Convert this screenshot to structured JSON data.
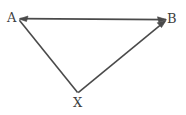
{
  "figure": {
    "type": "vector-triangle-diagram",
    "background_color": "#ffffff",
    "stroke_color": "#4a4a4a",
    "label_color": "#3f3f3f",
    "stroke_width": 1.6,
    "width": 186,
    "height": 115
  },
  "vertices": [
    {
      "id": "A",
      "label": "A",
      "x": 19,
      "y": 19,
      "label_x": 7,
      "label_y": 11
    },
    {
      "id": "B",
      "label": "B",
      "x": 166,
      "y": 20,
      "label_x": 167,
      "label_y": 12
    },
    {
      "id": "X",
      "label": "X",
      "x": 78,
      "y": 93,
      "label_x": 73,
      "label_y": 96
    }
  ],
  "edges": [
    {
      "id": "edge-b-to-a",
      "name": "arrow-B-to-A",
      "from": "B",
      "to": "A",
      "arrowhead_at": "A",
      "directed": true,
      "path": "M 166 19.6 L 20.2 18.6"
    },
    {
      "id": "edge-a-to-x",
      "name": "line-A-to-X",
      "from": "A",
      "to": "X",
      "arrowhead_at": "none",
      "directed": false,
      "path": "M 19.4 20.2 L 77.6 92.6"
    },
    {
      "id": "edge-x-to-b",
      "name": "arrow-X-to-B",
      "from": "X",
      "to": "B",
      "arrowhead_at": "B",
      "directed": true,
      "path": "M 78.2 92.6 L 164.6 21.6"
    }
  ],
  "arrowheads": [
    {
      "id": "head-at-A",
      "name": "arrowhead-at-A",
      "tip_x": 19,
      "tip_y": 19,
      "points": "19,19 28,16 26.5,21.5"
    },
    {
      "id": "head-at-B-top",
      "name": "arrowhead-at-B-from-A",
      "tip_x": 166,
      "tip_y": 19.6,
      "points": "166.5,19.6 157.5,16.8 158.8,22.3"
    },
    {
      "id": "head-at-B-diag",
      "name": "arrowhead-at-B-from-X",
      "tip_x": 166,
      "tip_y": 20.5,
      "points": "166,20.5 157.2,22.8 161.5,27.6"
    }
  ]
}
